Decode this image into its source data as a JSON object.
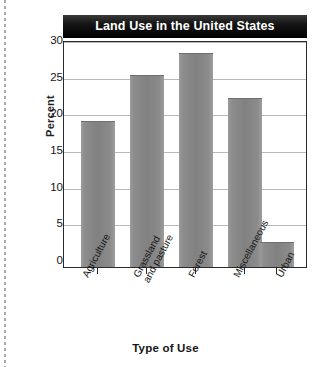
{
  "chart_data": {
    "type": "bar",
    "title": "Land Use in the United States",
    "xlabel": "Type of Use",
    "ylabel": "Percent",
    "categories": [
      "Agriculture",
      "Grassland and pasture",
      "Forest",
      "Miscellaneous",
      "Urban"
    ],
    "category_lines": [
      [
        "Agriculture"
      ],
      [
        "Grassland",
        "and pasture"
      ],
      [
        "Forest"
      ],
      [
        "Miscellaneous"
      ],
      [
        "Urban"
      ]
    ],
    "values": [
      20.0,
      26.3,
      29.3,
      23.2,
      3.3
    ],
    "ylim": [
      0,
      31
    ],
    "yticks": [
      0,
      5,
      10,
      15,
      20,
      25,
      30
    ],
    "ytick_labels": [
      "0",
      "5",
      "10",
      "15",
      "20",
      "25",
      "30"
    ],
    "grid": true,
    "legend": "none",
    "bar_color": "#888888",
    "title_background": "#000000",
    "title_color": "#ffffff"
  }
}
